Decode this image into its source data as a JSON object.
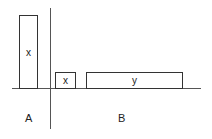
{
  "diagram": {
    "boxes": [
      {
        "id": "tall-x",
        "label": "x"
      },
      {
        "id": "small-x",
        "label": "x"
      },
      {
        "id": "wide-y",
        "label": "y"
      }
    ],
    "regions": [
      {
        "id": "A",
        "label": "A"
      },
      {
        "id": "B",
        "label": "B"
      }
    ]
  }
}
